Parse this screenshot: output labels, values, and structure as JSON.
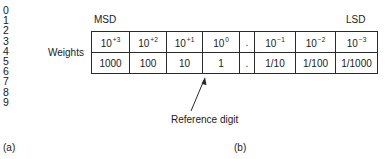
{
  "panel_a": {
    "digits": [
      "0",
      "1",
      "2",
      "3",
      "4",
      "5",
      "6",
      "7",
      "8",
      "9"
    ],
    "caption": "(a)"
  },
  "panel_b": {
    "msd_label": "MSD",
    "lsd_label": "LSD",
    "row_label": "Weights",
    "powers": [
      {
        "base": "10",
        "exp": "+3"
      },
      {
        "base": "10",
        "exp": "+2"
      },
      {
        "base": "10",
        "exp": "+1"
      },
      {
        "base": "10",
        "exp": "0"
      },
      {
        "base": ".",
        "exp": ""
      },
      {
        "base": "10",
        "exp": "−1"
      },
      {
        "base": "10",
        "exp": "−2"
      },
      {
        "base": "10",
        "exp": "−3"
      }
    ],
    "values": [
      "1000",
      "100",
      "10",
      "1",
      ".",
      "1/10",
      "1/100",
      "1/1000"
    ],
    "annotation": "Reference digit",
    "caption": "(b)"
  }
}
